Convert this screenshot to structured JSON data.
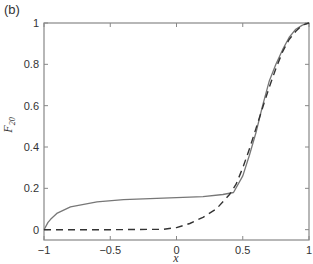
{
  "panel_label": "(b)",
  "chart_data": {
    "type": "line",
    "title": "",
    "xlabel": "x",
    "ylabel": "F",
    "ylabel_subscript": "20",
    "xlim": [
      -1,
      1
    ],
    "ylim": [
      -0.05,
      1
    ],
    "xticks": [
      -1,
      -0.5,
      0,
      0.5,
      1
    ],
    "xtick_labels": [
      "−1",
      "−0.5",
      "0",
      "0.5",
      "1"
    ],
    "yticks": [
      0,
      0.2,
      0.4,
      0.6,
      0.8,
      1
    ],
    "ytick_labels": [
      "0",
      "0.2",
      "0.4",
      "0.6",
      "0.8",
      "1"
    ],
    "grid": false,
    "legend": null,
    "series": [
      {
        "name": "solid",
        "style": "solid",
        "color": "#777777",
        "x": [
          -1,
          -0.97,
          -0.95,
          -0.9,
          -0.8,
          -0.6,
          -0.4,
          -0.2,
          0,
          0.2,
          0.35,
          0.43,
          0.5,
          0.55,
          0.6,
          0.65,
          0.7,
          0.75,
          0.8,
          0.85,
          0.9,
          0.95,
          1
        ],
        "y": [
          0,
          0.035,
          0.05,
          0.08,
          0.11,
          0.135,
          0.145,
          0.15,
          0.155,
          0.16,
          0.17,
          0.18,
          0.26,
          0.36,
          0.47,
          0.6,
          0.72,
          0.8,
          0.87,
          0.93,
          0.97,
          0.99,
          1
        ]
      },
      {
        "name": "dashed",
        "style": "dashed",
        "color": "#333333",
        "x": [
          -1,
          -0.5,
          -0.1,
          0,
          0.1,
          0.2,
          0.3,
          0.4,
          0.45,
          0.5,
          0.55,
          0.6,
          0.65,
          0.7,
          0.75,
          0.8,
          0.85,
          0.9,
          0.95,
          1
        ],
        "y": [
          0,
          0,
          0.002,
          0.01,
          0.03,
          0.06,
          0.1,
          0.17,
          0.22,
          0.3,
          0.39,
          0.49,
          0.59,
          0.69,
          0.78,
          0.86,
          0.92,
          0.96,
          0.99,
          1
        ]
      }
    ]
  }
}
